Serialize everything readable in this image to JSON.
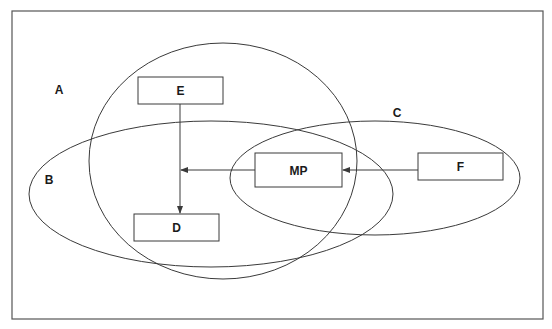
{
  "diagram": {
    "frame": {
      "x": 12,
      "y": 11,
      "width": 531,
      "height": 308
    },
    "region_labels": {
      "A": {
        "text": "A",
        "x": 59,
        "y": 94
      },
      "B": {
        "text": "B",
        "x": 49,
        "y": 184
      },
      "C": {
        "text": "C",
        "x": 397,
        "y": 117
      }
    },
    "ellipses": {
      "A": {
        "cx": 223,
        "cy": 161,
        "rx": 134,
        "ry": 118
      },
      "B": {
        "cx": 211,
        "cy": 194,
        "rx": 182,
        "ry": 73
      },
      "C": {
        "cx": 375,
        "cy": 178,
        "rx": 145,
        "ry": 57
      }
    },
    "boxes": {
      "E": {
        "text": "E",
        "x": 138,
        "y": 77,
        "w": 85,
        "h": 27
      },
      "MP": {
        "text": "MP",
        "x": 255,
        "y": 153,
        "w": 87,
        "h": 34
      },
      "F": {
        "text": "F",
        "x": 418,
        "y": 153,
        "w": 85,
        "h": 27
      },
      "D": {
        "text": "D",
        "x": 134,
        "y": 214,
        "w": 85,
        "h": 27
      }
    },
    "arrows": [
      {
        "from": "F",
        "to": "MP"
      },
      {
        "from": "MP",
        "to": "E-D line"
      },
      {
        "from": "E",
        "to": "D"
      }
    ],
    "colors": {
      "stroke": "#3a3a3a",
      "text": "#1a1a1a",
      "background": "#ffffff"
    }
  }
}
